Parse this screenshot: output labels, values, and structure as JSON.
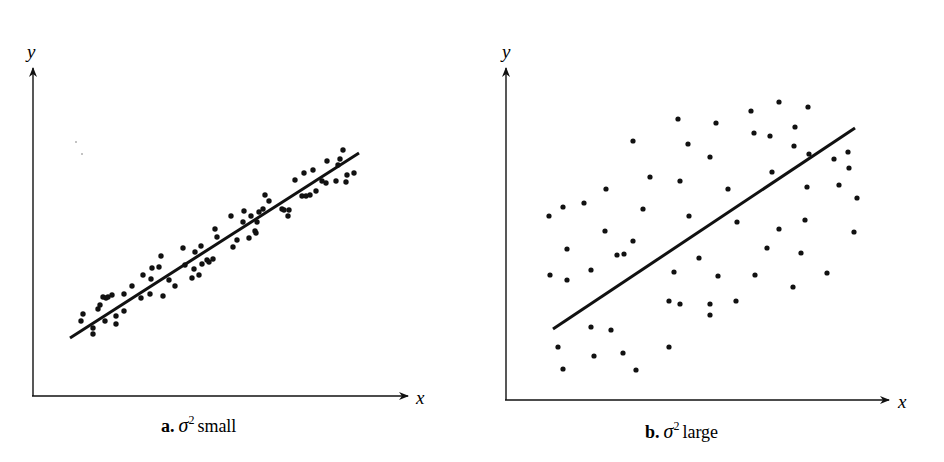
{
  "chart_data": [
    {
      "type": "scatter",
      "panel_label": "a.",
      "caption_symbol": "σ",
      "caption_superscript": "2",
      "caption_text": "small",
      "xlabel": "x",
      "ylabel": "y",
      "grid": false,
      "regression_line": {
        "x1": 70,
        "y1": 338,
        "x2": 359,
        "y2": 153
      },
      "points": [
        [
          81,
          321
        ],
        [
          83,
          314
        ],
        [
          93,
          334
        ],
        [
          93,
          328
        ],
        [
          98,
          309
        ],
        [
          100,
          305
        ],
        [
          103,
          297
        ],
        [
          106,
          298
        ],
        [
          108,
          297
        ],
        [
          112,
          295
        ],
        [
          105,
          321
        ],
        [
          116,
          316
        ],
        [
          116,
          324
        ],
        [
          124,
          311
        ],
        [
          124,
          294
        ],
        [
          132,
          286
        ],
        [
          141,
          298
        ],
        [
          143,
          275
        ],
        [
          150,
          294
        ],
        [
          151,
          279
        ],
        [
          152,
          268
        ],
        [
          159,
          267
        ],
        [
          163,
          296
        ],
        [
          161,
          256
        ],
        [
          169,
          280
        ],
        [
          175,
          286
        ],
        [
          183,
          248
        ],
        [
          185,
          265
        ],
        [
          192,
          278
        ],
        [
          194,
          269
        ],
        [
          195,
          252
        ],
        [
          199,
          275
        ],
        [
          202,
          264
        ],
        [
          201,
          246
        ],
        [
          207,
          260
        ],
        [
          209,
          262
        ],
        [
          213,
          259
        ],
        [
          215,
          229
        ],
        [
          217,
          237
        ],
        [
          231,
          216
        ],
        [
          233,
          247
        ],
        [
          237,
          240
        ],
        [
          243,
          222
        ],
        [
          244,
          211
        ],
        [
          249,
          238
        ],
        [
          251,
          216
        ],
        [
          255,
          231
        ],
        [
          256,
          233
        ],
        [
          257,
          222
        ],
        [
          259,
          212
        ],
        [
          263,
          209
        ],
        [
          265,
          195
        ],
        [
          269,
          201
        ],
        [
          282,
          209
        ],
        [
          284,
          210
        ],
        [
          288,
          216
        ],
        [
          289,
          210
        ],
        [
          295,
          180
        ],
        [
          302,
          196
        ],
        [
          304,
          173
        ],
        [
          306,
          196
        ],
        [
          310,
          195
        ],
        [
          313,
          170
        ],
        [
          316,
          191
        ],
        [
          322,
          181
        ],
        [
          326,
          183
        ],
        [
          327,
          161
        ],
        [
          336,
          181
        ],
        [
          338,
          165
        ],
        [
          340,
          159
        ],
        [
          343,
          150
        ],
        [
          346,
          182
        ],
        [
          347,
          175
        ],
        [
          354,
          173
        ]
      ]
    },
    {
      "type": "scatter",
      "panel_label": "b.",
      "caption_symbol": "σ",
      "caption_superscript": "2",
      "caption_text": "large",
      "xlabel": "x",
      "ylabel": "y",
      "grid": false,
      "regression_line": {
        "x1": 553,
        "y1": 329,
        "x2": 855,
        "y2": 128
      },
      "points": [
        [
          549,
          216
        ],
        [
          550,
          275
        ],
        [
          558,
          347
        ],
        [
          563,
          369
        ],
        [
          563,
          207
        ],
        [
          567,
          280
        ],
        [
          567,
          249
        ],
        [
          584,
          203
        ],
        [
          591,
          270
        ],
        [
          591,
          327
        ],
        [
          594,
          356
        ],
        [
          605,
          231
        ],
        [
          611,
          330
        ],
        [
          606,
          189
        ],
        [
          617,
          255
        ],
        [
          623,
          353
        ],
        [
          624,
          254
        ],
        [
          633,
          241
        ],
        [
          633,
          141
        ],
        [
          636,
          370
        ],
        [
          643,
          209
        ],
        [
          650,
          177
        ],
        [
          669,
          301
        ],
        [
          669,
          347
        ],
        [
          674,
          272
        ],
        [
          678,
          119
        ],
        [
          680,
          304
        ],
        [
          680,
          181
        ],
        [
          688,
          144
        ],
        [
          689,
          216
        ],
        [
          699,
          258
        ],
        [
          710,
          315
        ],
        [
          710,
          304
        ],
        [
          710,
          157
        ],
        [
          718,
          276
        ],
        [
          716,
          123
        ],
        [
          728,
          189
        ],
        [
          736,
          301
        ],
        [
          737,
          222
        ],
        [
          751,
          111
        ],
        [
          755,
          275
        ],
        [
          754,
          133
        ],
        [
          770,
          136
        ],
        [
          767,
          248
        ],
        [
          772,
          172
        ],
        [
          779,
          229
        ],
        [
          779,
          102
        ],
        [
          793,
          287
        ],
        [
          794,
          146
        ],
        [
          795,
          127
        ],
        [
          801,
          253
        ],
        [
          805,
          220
        ],
        [
          807,
          187
        ],
        [
          808,
          107
        ],
        [
          809,
          154
        ],
        [
          827,
          273
        ],
        [
          834,
          159
        ],
        [
          839,
          185
        ],
        [
          848,
          152
        ],
        [
          849,
          168
        ],
        [
          857,
          198
        ],
        [
          854,
          232
        ]
      ]
    }
  ],
  "panels": {
    "a": {
      "label": "a.",
      "sigma": "σ",
      "sup": "2",
      "text": "small",
      "xaxis": "x",
      "yaxis": "y"
    },
    "b": {
      "label": "b.",
      "sigma": "σ",
      "sup": "2",
      "text": "large",
      "xaxis": "x",
      "yaxis": "y"
    }
  }
}
